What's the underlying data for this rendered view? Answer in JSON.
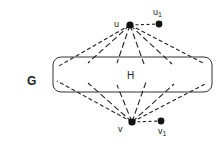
{
  "diagram": {
    "graph_label": "G",
    "subgraph_label": "H",
    "vertices": {
      "u": {
        "label": "u",
        "x": 130,
        "y": 25
      },
      "u1": {
        "label": "u",
        "sub": "1",
        "x": 159,
        "y": 24
      },
      "v": {
        "label": "v",
        "x": 132,
        "y": 122
      },
      "v1": {
        "label": "v",
        "sub": "1",
        "x": 161,
        "y": 121
      }
    },
    "subgraph_box": {
      "x": 53,
      "y": 57,
      "width": 159,
      "height": 35,
      "rx": 8
    },
    "upper_edges_ends": [
      [
        57,
        67
      ],
      [
        88,
        63
      ],
      [
        117,
        63
      ],
      [
        144,
        64
      ],
      [
        172,
        64
      ],
      [
        205,
        64
      ]
    ],
    "lower_edges_starts": [
      [
        57,
        81
      ],
      [
        88,
        83
      ],
      [
        117,
        85
      ],
      [
        146,
        82
      ],
      [
        174,
        84
      ],
      [
        205,
        84
      ]
    ],
    "colors": {
      "stroke": "#222222",
      "vertex": "#111111"
    }
  }
}
